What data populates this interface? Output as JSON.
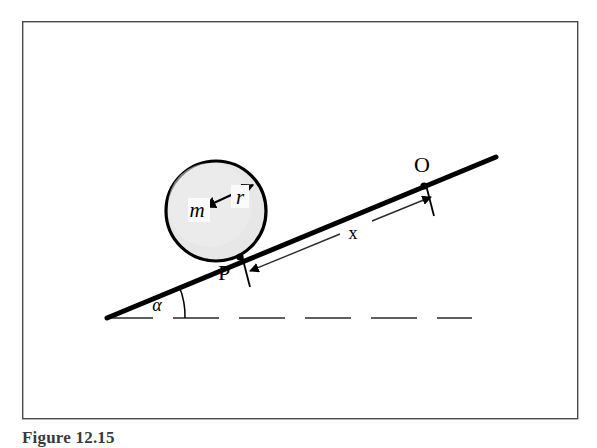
{
  "figure": {
    "caption": "Figure 12.15",
    "background_color": "#ffffff",
    "frame": {
      "name": "figure-border",
      "x": 22,
      "y": 21,
      "width": 556,
      "height": 398,
      "stroke_color": "#4a4a4a",
      "stroke_width": 1.4
    }
  },
  "labels": {
    "mass": "m",
    "radius": "r",
    "contact_point": "P",
    "origin_point": "O",
    "distance": "x",
    "angle": "α"
  },
  "diagram": {
    "type": "inclined-plane-rolling-cylinder",
    "incline": {
      "name": "incline-line",
      "x1": 107,
      "y1": 318,
      "x2": 496,
      "y2": 157,
      "stroke_color": "#000000",
      "stroke_width": 5.0,
      "angle_degrees": 22.5
    },
    "baseline": {
      "name": "horizontal-dashed-line",
      "x1": 107,
      "y1": 318,
      "x2": 472,
      "y2": 318,
      "stroke_color": "#2b2b2b",
      "stroke_width": 1.6,
      "dash_pattern": "46 20"
    },
    "angle_arc": {
      "name": "angle-arc",
      "center_x": 107,
      "center_y": 318,
      "radius": 78,
      "stroke_color": "#000000",
      "stroke_width": 1.5
    },
    "circle": {
      "name": "rolling-body",
      "cx": 216,
      "cy": 211,
      "r": 50,
      "fill_color": "#e7e7e7",
      "stroke_color": "#000000",
      "stroke_width": 3.2
    },
    "radius_arrow": {
      "name": "radius-dimension-arrow",
      "x1": 203,
      "y1": 206,
      "x2": 254,
      "y2": 185,
      "stroke_color": "#000000",
      "stroke_width": 2.0
    },
    "contact_marker": {
      "name": "contact-point-P",
      "cx": 240,
      "cy": 257
    },
    "origin_marker": {
      "name": "origin-point-O",
      "cx": 424,
      "cy": 186
    },
    "tick_p": {
      "name": "tick-at-P",
      "x1": 243,
      "y1": 258,
      "x2": 250,
      "y2": 285,
      "stroke_color": "#000000",
      "stroke_width": 1.8
    },
    "tick_o": {
      "name": "tick-at-O",
      "x1": 427,
      "y1": 187,
      "x2": 434,
      "y2": 214,
      "stroke_color": "#000000",
      "stroke_width": 1.8
    },
    "dimension_line": {
      "name": "x-dimension-line",
      "x1": 248,
      "y1": 272,
      "x2": 430,
      "y2": 198,
      "stroke_color": "#2b2b2b",
      "stroke_width": 1.4
    }
  },
  "label_positions": {
    "mass": {
      "x": 197,
      "y": 216,
      "size": 21
    },
    "radius": {
      "x": 240,
      "y": 203,
      "size": 21
    },
    "contact_point": {
      "x": 224,
      "y": 279,
      "size": 22
    },
    "origin_point": {
      "x": 421,
      "y": 172,
      "size": 22
    },
    "distance": {
      "x": 352,
      "y": 238,
      "size": 18
    },
    "angle": {
      "x": 154,
      "y": 310,
      "size": 18
    }
  }
}
